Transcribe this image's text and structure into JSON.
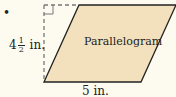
{
  "figure": {
    "bullet": "•",
    "shape_name": "Parallelogram",
    "height": {
      "whole": "4",
      "numerator": "1",
      "denominator": "2",
      "unit": "in."
    },
    "base": "5 in.",
    "colors": {
      "fill": "#f3e1bd",
      "stroke": "#222222",
      "dash": "#777777",
      "background": "#fdfbf0"
    }
  }
}
